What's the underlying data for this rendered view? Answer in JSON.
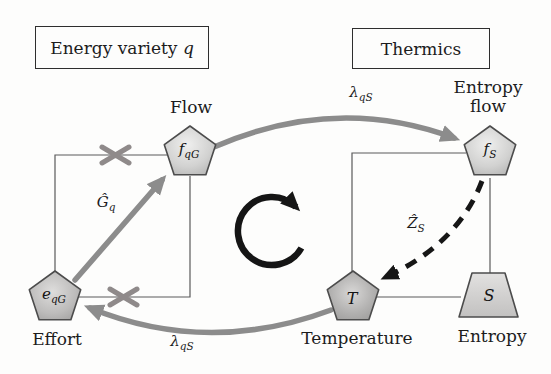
{
  "boxes": {
    "left": {
      "text": "Energy variety",
      "var": "q"
    },
    "right": {
      "text": "Thermics"
    }
  },
  "nodes": {
    "flow": {
      "base": "f",
      "sub": "qG",
      "caption": "Flow"
    },
    "entropy_flow": {
      "base": "f",
      "sub": "S",
      "caption_line1": "Entropy",
      "caption_line2": "flow"
    },
    "effort": {
      "base": "e",
      "sub": "qG",
      "caption": "Effort"
    },
    "temperature": {
      "base": "T",
      "sub": "",
      "caption": "Temperature"
    },
    "entropy": {
      "base": "S",
      "sub": "",
      "caption": "Entropy"
    }
  },
  "operators": {
    "coupling_top": {
      "base": "λ",
      "sub": "qS"
    },
    "coupling_bottom": {
      "base": "λ",
      "sub": "qS"
    },
    "conductance": {
      "base": "Ĝ",
      "sub": "q"
    },
    "impedance": {
      "base": "Ẑ",
      "sub": "S"
    }
  },
  "icons": {
    "center": "clockwise-loop-arrow",
    "crossed_links": 2
  },
  "colors": {
    "background": "#fdfdfc",
    "thick_arrow_gray": "#8c8c8c",
    "cross_mark": "#8f8a8a",
    "wire": "#5a5a5a",
    "node_border": "#4c4c4c",
    "node_fill_light": "#e9e9e9",
    "node_fill_dark": "#a6a6a6",
    "dashed_arrow": "#161616",
    "text": "#1c1c1c"
  }
}
